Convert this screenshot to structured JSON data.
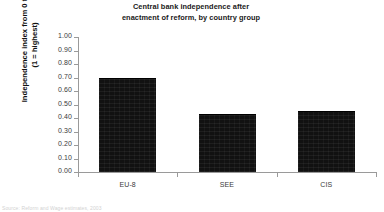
{
  "chart_data": {
    "type": "bar",
    "title": "Central bank independence after enactment of reform, by country group",
    "title_lines": [
      "Central bank independence after",
      "enactment of reform, by country group"
    ],
    "categories": [
      "EU-8",
      "SEE",
      "CIS"
    ],
    "values": [
      0.7,
      0.43,
      0.45
    ],
    "xlabel": "",
    "ylabel": "Independence index from 0 to 1 (1 = highest)",
    "ylabel_lines": [
      "Independence index from 0 to 1",
      "(1 = highest)"
    ],
    "ylim": [
      0.0,
      1.0
    ],
    "ytick_step": 0.1,
    "ytick_labels": [
      "1.00",
      "0.90",
      "0.80",
      "0.70",
      "0.60",
      "0.50",
      "0.40",
      "0.30",
      "0.20",
      "0.10",
      "0.00"
    ],
    "ytick_values": [
      1.0,
      0.9,
      0.8,
      0.7,
      0.6,
      0.5,
      0.4,
      0.3,
      0.2,
      0.1,
      0.0
    ],
    "grid": false,
    "legend": null,
    "series_color": "#111111",
    "axis_color": "#9a9a9a",
    "annotations": []
  },
  "footer": {
    "source_note": "Source: Reform and Wage estimates, 2003"
  }
}
